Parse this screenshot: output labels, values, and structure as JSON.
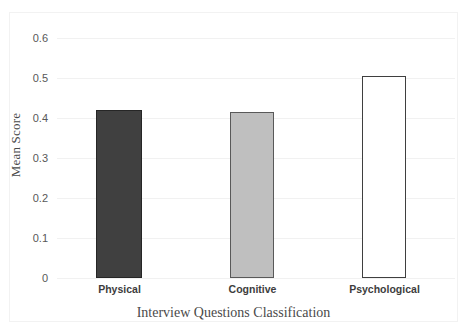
{
  "chart_data": {
    "type": "bar",
    "title": "",
    "subtitle": "",
    "categories": [
      "Physical",
      "Cognitive",
      "Psychological"
    ],
    "values": [
      0.42,
      0.415,
      0.505
    ],
    "series": [
      {
        "name": "Mean Score",
        "values": [
          0.42,
          0.415,
          0.505
        ]
      }
    ],
    "xlabel": "Interview Questions Classification",
    "ylabel": "Mean Score",
    "ylim": [
      0,
      0.6
    ],
    "ytick_labels": [
      "0",
      "0.1",
      "0.2",
      "0.3",
      "0.4",
      "0.5",
      "0.6"
    ],
    "ytick_values": [
      0,
      0.1,
      0.2,
      0.3,
      0.4,
      0.5,
      0.6
    ],
    "grid": true,
    "grid_axis": "y",
    "legend": false,
    "legend_position": "none",
    "bar_colors": [
      "#404040",
      "#bfbfbf",
      "#ffffff"
    ],
    "bar_border_colors": [
      "#262626",
      "#595959",
      "#3f3f3f"
    ],
    "gridline_color": "#f1f1f1",
    "text_color": "#4a4a4a",
    "background_color": "#ffffff"
  }
}
